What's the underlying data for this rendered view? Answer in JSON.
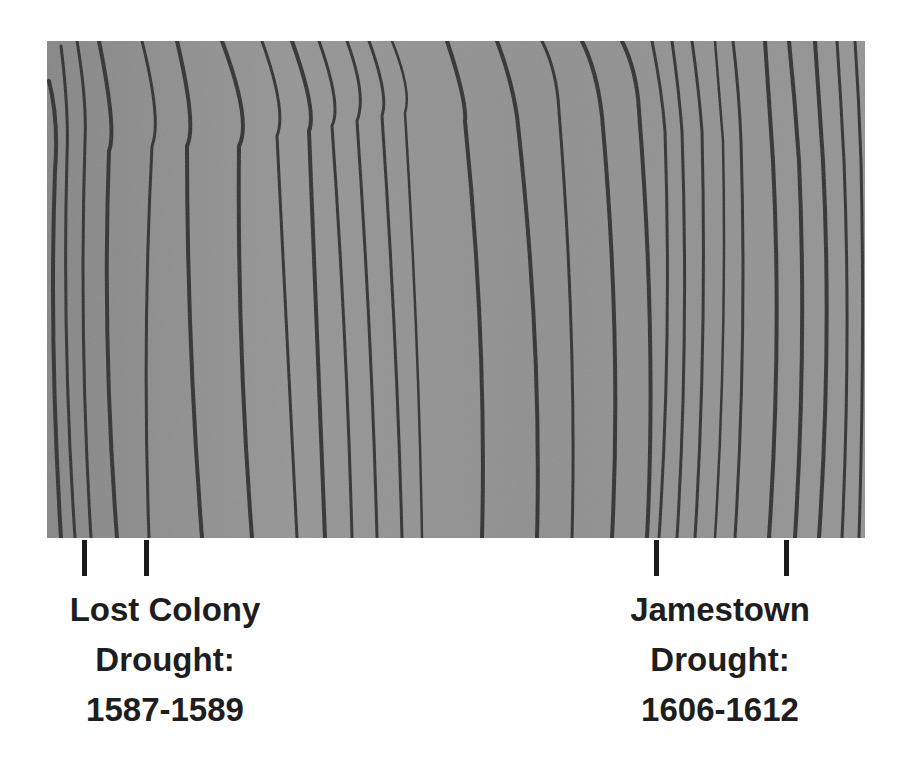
{
  "image": {
    "subject": "tree-ring cross-section photograph (grayscale)",
    "background_color": "#ffffff",
    "wood_base_color": "#8f8f8f",
    "ring_line_color": "#2e2e2e"
  },
  "annotations": [
    {
      "id": "lost-colony",
      "lines": [
        "Lost Colony",
        "Drought:",
        "1587-1589"
      ],
      "marker_x": [
        84,
        146
      ]
    },
    {
      "id": "jamestown",
      "lines": [
        "Jamestown",
        "Drought:",
        "1606-1612"
      ],
      "marker_x": [
        656,
        786
      ]
    }
  ]
}
